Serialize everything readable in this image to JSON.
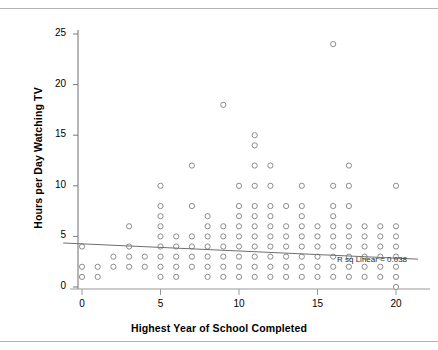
{
  "chart_data": {
    "type": "scatter",
    "title": "",
    "xlabel": "Highest Year of School Completed",
    "ylabel": "Hours per Day Watching TV",
    "xlim": [
      -1.2,
      21.5
    ],
    "ylim": [
      -1.0,
      26.5
    ],
    "xticks": [
      0,
      5,
      10,
      15,
      20
    ],
    "yticks": [
      0,
      5,
      10,
      15,
      20,
      25
    ],
    "xtick_labels": [
      "0",
      "5",
      "10",
      "15",
      "20"
    ],
    "ytick_labels": [
      "0",
      "5",
      "10",
      "15",
      "20",
      "25"
    ],
    "grid": false,
    "legend": null,
    "marker": {
      "style": "open-circle",
      "edge_color": "#8c8c8c",
      "fill_color": "#ffffff",
      "radius": 2.6,
      "line_width": 1.0
    },
    "annotations": [
      {
        "name": "r-squared-annotation",
        "text": "R sq Linear = 0.038",
        "x": 15.6,
        "y": 2.05
      }
    ],
    "fit_line": {
      "name": "linear-regression-line",
      "label": "R sq Linear = 0.038",
      "r_squared": 0.038,
      "color": "#6e6e6e",
      "x_start": -1.2,
      "y_start": 4.35,
      "x_end": 21.4,
      "y_end": 2.75
    },
    "points": [
      [
        0,
        1
      ],
      [
        0,
        2
      ],
      [
        0,
        4
      ],
      [
        1,
        1
      ],
      [
        1,
        2
      ],
      [
        2,
        2
      ],
      [
        2,
        3
      ],
      [
        3,
        2
      ],
      [
        3,
        3
      ],
      [
        3,
        4
      ],
      [
        3,
        6
      ],
      [
        4,
        2
      ],
      [
        4,
        3
      ],
      [
        5,
        1
      ],
      [
        5,
        2
      ],
      [
        5,
        3
      ],
      [
        5,
        4
      ],
      [
        5,
        5
      ],
      [
        5,
        6
      ],
      [
        5,
        7
      ],
      [
        5,
        8
      ],
      [
        5,
        10
      ],
      [
        6,
        1
      ],
      [
        6,
        2
      ],
      [
        6,
        3
      ],
      [
        6,
        4
      ],
      [
        6,
        5
      ],
      [
        7,
        2
      ],
      [
        7,
        3
      ],
      [
        7,
        4
      ],
      [
        7,
        5
      ],
      [
        7,
        8
      ],
      [
        7,
        12
      ],
      [
        8,
        1
      ],
      [
        8,
        2
      ],
      [
        8,
        3
      ],
      [
        8,
        4
      ],
      [
        8,
        5
      ],
      [
        8,
        6
      ],
      [
        8,
        7
      ],
      [
        9,
        1
      ],
      [
        9,
        2
      ],
      [
        9,
        3
      ],
      [
        9,
        4
      ],
      [
        9,
        5
      ],
      [
        9,
        6
      ],
      [
        9,
        18
      ],
      [
        10,
        1
      ],
      [
        10,
        2
      ],
      [
        10,
        3
      ],
      [
        10,
        4
      ],
      [
        10,
        5
      ],
      [
        10,
        6
      ],
      [
        10,
        7
      ],
      [
        10,
        8
      ],
      [
        10,
        10
      ],
      [
        11,
        1
      ],
      [
        11,
        2
      ],
      [
        11,
        3
      ],
      [
        11,
        4
      ],
      [
        11,
        5
      ],
      [
        11,
        6
      ],
      [
        11,
        7
      ],
      [
        11,
        8
      ],
      [
        11,
        10
      ],
      [
        11,
        12
      ],
      [
        11,
        14
      ],
      [
        11,
        15
      ],
      [
        12,
        1
      ],
      [
        12,
        2
      ],
      [
        12,
        3
      ],
      [
        12,
        4
      ],
      [
        12,
        5
      ],
      [
        12,
        6
      ],
      [
        12,
        7
      ],
      [
        12,
        8
      ],
      [
        12,
        10
      ],
      [
        12,
        12
      ],
      [
        13,
        1
      ],
      [
        13,
        2
      ],
      [
        13,
        3
      ],
      [
        13,
        4
      ],
      [
        13,
        5
      ],
      [
        13,
        6
      ],
      [
        13,
        8
      ],
      [
        14,
        1
      ],
      [
        14,
        2
      ],
      [
        14,
        3
      ],
      [
        14,
        4
      ],
      [
        14,
        5
      ],
      [
        14,
        6
      ],
      [
        14,
        7
      ],
      [
        14,
        8
      ],
      [
        14,
        10
      ],
      [
        15,
        1
      ],
      [
        15,
        2
      ],
      [
        15,
        3
      ],
      [
        15,
        4
      ],
      [
        15,
        5
      ],
      [
        15,
        6
      ],
      [
        16,
        1
      ],
      [
        16,
        2
      ],
      [
        16,
        3
      ],
      [
        16,
        4
      ],
      [
        16,
        5
      ],
      [
        16,
        6
      ],
      [
        16,
        7
      ],
      [
        16,
        8
      ],
      [
        16,
        10
      ],
      [
        16,
        24
      ],
      [
        17,
        1
      ],
      [
        17,
        2
      ],
      [
        17,
        3
      ],
      [
        17,
        4
      ],
      [
        17,
        5
      ],
      [
        17,
        6
      ],
      [
        17,
        8
      ],
      [
        17,
        10
      ],
      [
        17,
        12
      ],
      [
        18,
        1
      ],
      [
        18,
        2
      ],
      [
        18,
        3
      ],
      [
        18,
        4
      ],
      [
        18,
        5
      ],
      [
        18,
        6
      ],
      [
        19,
        1
      ],
      [
        19,
        2
      ],
      [
        19,
        3
      ],
      [
        19,
        4
      ],
      [
        19,
        5
      ],
      [
        19,
        6
      ],
      [
        20,
        0
      ],
      [
        20,
        1
      ],
      [
        20,
        2
      ],
      [
        20,
        3
      ],
      [
        20,
        4
      ],
      [
        20,
        5
      ],
      [
        20,
        6
      ],
      [
        20,
        10
      ]
    ]
  },
  "axes": {
    "x_title": "Highest Year of School Completed",
    "y_title": "Hours per Day Watching TV"
  }
}
